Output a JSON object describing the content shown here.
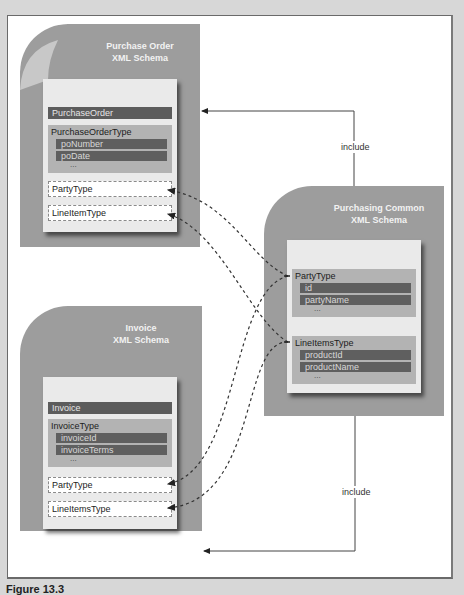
{
  "diagram": {
    "purchase_order": {
      "title_line1": "Purchase Order",
      "title_line2": "XML Schema",
      "element_bar": "PurchaseOrder",
      "type": {
        "name": "PurchaseOrderType",
        "fields": [
          "poNumber",
          "poDate"
        ],
        "more": "..."
      },
      "refs": [
        "PartyType",
        "LineItemType"
      ]
    },
    "invoice": {
      "title_line1": "Invoice",
      "title_line2": "XML Schema",
      "element_bar": "Invoice",
      "type": {
        "name": "InvoiceType",
        "fields": [
          "invoiceId",
          "invoiceTerms"
        ],
        "more": "..."
      },
      "refs": [
        "PartyType",
        "LineItemsType"
      ]
    },
    "common": {
      "title_line1": "Purchasing Common",
      "title_line2": "XML Schema",
      "types": [
        {
          "name": "PartyType",
          "fields": [
            "id",
            "partyName"
          ],
          "more": "..."
        },
        {
          "name": "LineItemsType",
          "fields": [
            "productId",
            "productName"
          ],
          "more": "..."
        }
      ]
    },
    "connectors": {
      "include_top": "include",
      "include_bottom": "include"
    },
    "caption": "Figure 13.3"
  }
}
